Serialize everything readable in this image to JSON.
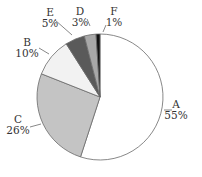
{
  "chart_data": {
    "type": "pie",
    "title": "",
    "categories": [
      "A",
      "C",
      "B",
      "E",
      "D",
      "F"
    ],
    "values": [
      55,
      26,
      10,
      5,
      3,
      1
    ],
    "labels": [
      "55%",
      "26%",
      "10%",
      "5%",
      "3%",
      "1%"
    ],
    "colors": [
      "#ffffff",
      "#c4c4c4",
      "#f2f2f2",
      "#5a5a5a",
      "#a8a8a8",
      "#111111"
    ],
    "start_angle": "12 o'clock",
    "direction": "clockwise",
    "legend": "none (labels with leader lines)",
    "slices": [
      {
        "name": "A",
        "value": 55,
        "label": "55%",
        "color": "#ffffff"
      },
      {
        "name": "C",
        "value": 26,
        "label": "26%",
        "color": "#c4c4c4"
      },
      {
        "name": "B",
        "value": 10,
        "label": "10%",
        "color": "#f2f2f2"
      },
      {
        "name": "E",
        "value": 5,
        "label": "5%",
        "color": "#5a5a5a"
      },
      {
        "name": "D",
        "value": 3,
        "label": "3%",
        "color": "#a8a8a8"
      },
      {
        "name": "F",
        "value": 1,
        "label": "1%",
        "color": "#111111"
      }
    ]
  }
}
